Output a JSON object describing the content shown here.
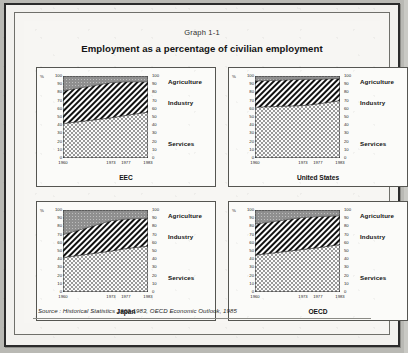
{
  "document": {
    "graph_number": "Graph 1-1",
    "title": "Employment as a percentage of civilian employment",
    "source": "Source : Historical Statistics 1960-1983, OECD Economic Outlook, 1985"
  },
  "axis": {
    "percent_symbol": "%",
    "y_ticks": [
      "100",
      "90",
      "80",
      "70",
      "60",
      "50",
      "40",
      "30",
      "20",
      "10",
      "0"
    ],
    "x_ticks": [
      "1960",
      "1973",
      "1977",
      "1983"
    ],
    "ylim": [
      0,
      100
    ]
  },
  "legend": {
    "agriculture": "Agriculture",
    "industry": "Industry",
    "services": "Services"
  },
  "chart_data": [
    {
      "type": "area",
      "title": "EEC",
      "xlabel": "",
      "ylabel": "%",
      "ylim": [
        0,
        100
      ],
      "x": [
        1960,
        1973,
        1977,
        1983
      ],
      "xtick_labels": [
        "1960",
        "1973",
        "1977",
        "1983"
      ],
      "stacked": true,
      "grid": false,
      "legend_position": "right",
      "series": [
        {
          "name": "Services",
          "values": [
            42,
            49,
            52,
            56
          ]
        },
        {
          "name": "Industry",
          "values": [
            40,
            43,
            41,
            37
          ]
        },
        {
          "name": "Agriculture",
          "values": [
            18,
            8,
            7,
            7
          ]
        }
      ]
    },
    {
      "type": "area",
      "title": "United States",
      "xlabel": "",
      "ylabel": "%",
      "ylim": [
        0,
        100
      ],
      "x": [
        1960,
        1973,
        1977,
        1983
      ],
      "xtick_labels": [
        "1960",
        "1973",
        "1977",
        "1983"
      ],
      "stacked": true,
      "grid": false,
      "legend_position": "right",
      "series": [
        {
          "name": "Services",
          "values": [
            62,
            64,
            66,
            70
          ]
        },
        {
          "name": "Industry",
          "values": [
            32,
            32,
            30,
            27
          ]
        },
        {
          "name": "Agriculture",
          "values": [
            6,
            4,
            4,
            3
          ]
        }
      ]
    },
    {
      "type": "area",
      "title": "Japan",
      "xlabel": "",
      "ylabel": "%",
      "ylim": [
        0,
        100
      ],
      "x": [
        1960,
        1973,
        1977,
        1983
      ],
      "xtick_labels": [
        "1960",
        "1973",
        "1977",
        "1983"
      ],
      "stacked": true,
      "grid": false,
      "legend_position": "right",
      "series": [
        {
          "name": "Services",
          "values": [
            42,
            50,
            53,
            56
          ]
        },
        {
          "name": "Industry",
          "values": [
            28,
            37,
            36,
            34
          ]
        },
        {
          "name": "Agriculture",
          "values": [
            30,
            13,
            11,
            10
          ]
        }
      ]
    },
    {
      "type": "area",
      "title": "OECD",
      "xlabel": "",
      "ylabel": "%",
      "ylim": [
        0,
        100
      ],
      "x": [
        1960,
        1973,
        1977,
        1983
      ],
      "xtick_labels": [
        "1960",
        "1973",
        "1977",
        "1983"
      ],
      "stacked": true,
      "grid": false,
      "legend_position": "right",
      "series": [
        {
          "name": "Services",
          "values": [
            45,
            52,
            54,
            58
          ]
        },
        {
          "name": "Industry",
          "values": [
            38,
            39,
            38,
            35
          ]
        },
        {
          "name": "Agriculture",
          "values": [
            17,
            9,
            8,
            7
          ]
        }
      ]
    }
  ],
  "colors": {
    "agriculture_fill": "#8f8f8f",
    "industry_fill": "#111111",
    "services_fill": "#d8d8d8",
    "axis": "#1e1e1e",
    "frame": "#2b2b2b",
    "paper": "#f7f6f3"
  }
}
